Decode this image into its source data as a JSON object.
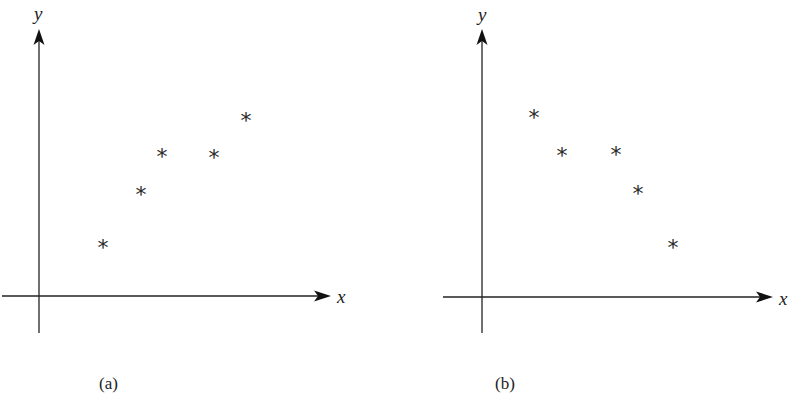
{
  "chart_data": [
    {
      "type": "scatter",
      "panel": "a",
      "caption": "(a)",
      "title": "",
      "xlabel": "x",
      "ylabel": "y",
      "marker": "*",
      "grid": false,
      "ticks": false,
      "trend": "increasing",
      "points": [
        {
          "x": 1.0,
          "y": 1.0
        },
        {
          "x": 1.6,
          "y": 1.9
        },
        {
          "x": 2.0,
          "y": 2.5
        },
        {
          "x": 2.8,
          "y": 2.5
        },
        {
          "x": 3.4,
          "y": 3.1
        }
      ],
      "pixel": {
        "origin": [
          39,
          296
        ],
        "x_axis": {
          "x1": 2,
          "x2": 330,
          "y": 296
        },
        "y_axis": {
          "x": 39,
          "y1": 333,
          "y2": 30
        },
        "xlabel_pos": [
          337,
          303
        ],
        "ylabel_pos": [
          34,
          20
        ],
        "caption_pos": [
          99,
          389
        ],
        "stars": [
          [
            103,
            243
          ],
          [
            141,
            190
          ],
          [
            162,
            152
          ],
          [
            214,
            153
          ],
          [
            246,
            116
          ]
        ]
      }
    },
    {
      "type": "scatter",
      "panel": "b",
      "caption": "(b)",
      "title": "",
      "xlabel": "x",
      "ylabel": "y",
      "marker": "*",
      "grid": false,
      "ticks": false,
      "trend": "decreasing",
      "points": [
        {
          "x": 1.0,
          "y": 3.1
        },
        {
          "x": 1.5,
          "y": 2.5
        },
        {
          "x": 2.5,
          "y": 2.5
        },
        {
          "x": 2.9,
          "y": 1.9
        },
        {
          "x": 3.6,
          "y": 1.0
        }
      ],
      "pixel": {
        "origin": [
          482,
          297
        ],
        "x_axis": {
          "x1": 443,
          "x2": 772,
          "y": 297
        },
        "y_axis": {
          "x": 482,
          "y1": 333,
          "y2": 30
        },
        "xlabel_pos": [
          779,
          305
        ],
        "ylabel_pos": [
          478,
          21
        ],
        "caption_pos": [
          495,
          389
        ],
        "stars": [
          [
            534,
            113
          ],
          [
            562,
            151
          ],
          [
            616,
            150
          ],
          [
            638,
            189
          ],
          [
            673,
            243
          ]
        ]
      }
    }
  ],
  "labels": {
    "a": {
      "x": "x",
      "y": "y",
      "caption": "(a)"
    },
    "b": {
      "x": "x",
      "y": "y",
      "caption": "(b)"
    },
    "marker_glyph": "*"
  }
}
